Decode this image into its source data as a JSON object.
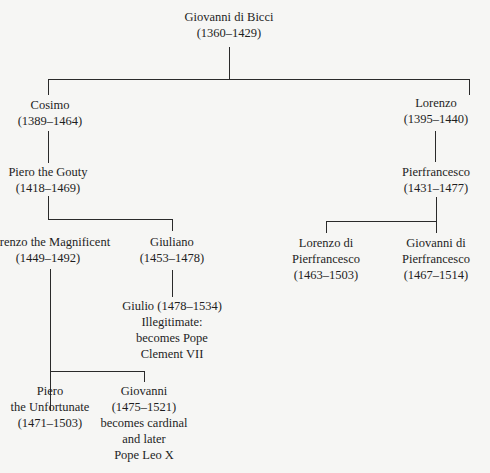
{
  "diagram": {
    "type": "family-tree",
    "nodes": {
      "giovanni_di_bicci": {
        "name": "Giovanni di Bicci",
        "dates": "(1360–1429)"
      },
      "cosimo": {
        "name": "Cosimo",
        "dates": "(1389–1464)"
      },
      "lorenzo_elder": {
        "name": "Lorenzo",
        "dates": "(1395–1440)"
      },
      "piero_gouty": {
        "name": "Piero the Gouty",
        "dates": "(1418–1469)"
      },
      "pierfrancesco": {
        "name": "Pierfrancesco",
        "dates": "(1431–1477)"
      },
      "lorenzo_magnificent": {
        "name": "Lorenzo the Magnificent",
        "dates": "(1449–1492)"
      },
      "giuliano": {
        "name": "Giuliano",
        "dates": "(1453–1478)"
      },
      "lorenzo_di_pierfrancesco": {
        "name_line1": "Lorenzo di",
        "name_line2": "Pierfrancesco",
        "dates": "(1463–1503)"
      },
      "giovanni_di_pierfrancesco": {
        "name_line1": "Giovanni di",
        "name_line2": "Pierfrancesco",
        "dates": "(1467–1514)"
      },
      "giulio": {
        "line1": "Giulio (1478–1534)",
        "line2": "Illegitimate:",
        "line3": "becomes Pope",
        "line4": "Clement VII"
      },
      "piero_unfortunate": {
        "name_line1": "Piero",
        "name_line2": "the Unfortunate",
        "dates": "(1471–1503)"
      },
      "giovanni_leo": {
        "name": "Giovanni",
        "dates": "(1475–1521)",
        "note_line1": "becomes cardinal",
        "note_line2": "and later",
        "note_line3": "Pope Leo X"
      }
    },
    "edges": [
      [
        "giovanni_di_bicci",
        "cosimo"
      ],
      [
        "giovanni_di_bicci",
        "lorenzo_elder"
      ],
      [
        "cosimo",
        "piero_gouty"
      ],
      [
        "lorenzo_elder",
        "pierfrancesco"
      ],
      [
        "piero_gouty",
        "lorenzo_magnificent"
      ],
      [
        "piero_gouty",
        "giuliano"
      ],
      [
        "giuliano",
        "giulio"
      ],
      [
        "pierfrancesco",
        "lorenzo_di_pierfrancesco"
      ],
      [
        "pierfrancesco",
        "giovanni_di_pierfrancesco"
      ],
      [
        "lorenzo_magnificent",
        "piero_unfortunate"
      ],
      [
        "lorenzo_magnificent",
        "giovanni_leo"
      ]
    ]
  }
}
